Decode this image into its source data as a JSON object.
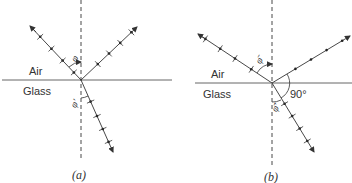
{
  "panels": [
    {
      "id": "a",
      "caption": "(a)",
      "medium_top": "Air",
      "medium_bottom": "Glass",
      "incident_angle_label": "φ",
      "refracted_angle_label": "φ'",
      "reflected_polarization": "both",
      "right_angle_label": null
    },
    {
      "id": "b",
      "caption": "(b)",
      "medium_top": "Air",
      "medium_bottom": "Glass",
      "incident_angle_label": "φ̄",
      "refracted_angle_label": "φ̄'",
      "reflected_polarization": "perpendicular-only",
      "right_angle_label": "90°"
    }
  ]
}
